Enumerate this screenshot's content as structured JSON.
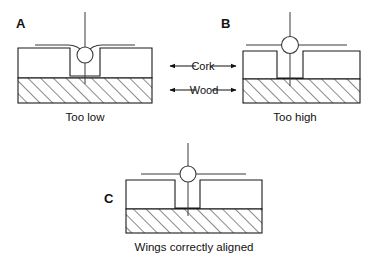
{
  "figure": {
    "panels": [
      {
        "id": "A",
        "letter": "A",
        "caption": "Too low",
        "state": "bead-below-surface"
      },
      {
        "id": "B",
        "letter": "B",
        "caption": "Too high",
        "state": "bead-above-surface"
      },
      {
        "id": "C",
        "letter": "C",
        "caption": "Wings correctly aligned",
        "state": "bead-level-with-surface"
      }
    ],
    "layer_labels": [
      {
        "id": "cork",
        "text": "Cork"
      },
      {
        "id": "wood",
        "text": "Wood"
      }
    ],
    "colors": {
      "cork_fill": "#e9e9e9",
      "wood_fill": "#ffffff",
      "hatch_stroke": "#2b2b2b",
      "outline": "#1a1a1a",
      "detail_stroke": "#3a3a3a",
      "text": "#111111",
      "background": "#ffffff"
    }
  }
}
